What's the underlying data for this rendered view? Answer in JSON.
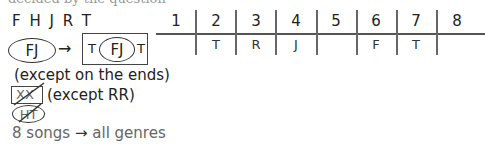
{
  "header": {
    "cutoff_text": "decided by the question"
  },
  "notes": {
    "letters": "F H J R T",
    "rule1": {
      "left_block": "FJ",
      "arrow": "→",
      "right_block": {
        "left": "T",
        "center": "FJ",
        "right": "T"
      },
      "caveat": "(except on the ends)"
    },
    "rule2": {
      "crossed_box": "XX",
      "caveat": "(except RR)"
    },
    "rule3": {
      "crossed_ellipse": "HT"
    },
    "rule4": {
      "left": "8 songs",
      "arrow": "→",
      "right": "all genres"
    }
  },
  "slots": {
    "headers": [
      "1",
      "2",
      "3",
      "4",
      "5",
      "6",
      "7",
      "8"
    ],
    "values": [
      "",
      "T",
      "R",
      "J",
      "",
      "F",
      "T",
      ""
    ]
  }
}
